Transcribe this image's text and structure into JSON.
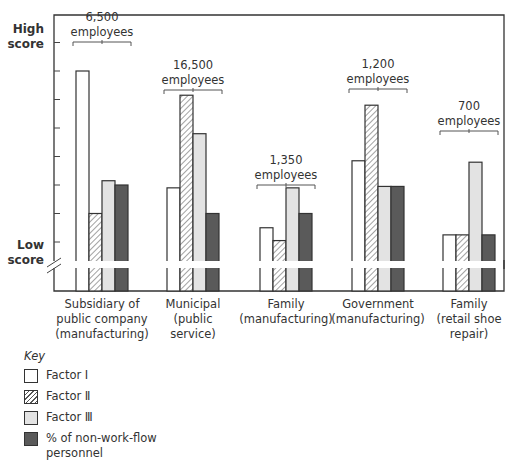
{
  "y_axis": {
    "high_label": "High\nscore",
    "low_label": "Low\nscore"
  },
  "key": {
    "title": "Key",
    "items": [
      {
        "label": "Factor Ⅰ",
        "style": "white"
      },
      {
        "label": "Factor Ⅱ",
        "style": "hatch"
      },
      {
        "label": "Factor Ⅲ",
        "style": "light"
      },
      {
        "label": "% of non-work-flow\npersonnel",
        "style": "dark"
      }
    ]
  },
  "groups": [
    {
      "size_label": "6,500\nemployees",
      "category": "Subsidiary of\npublic company\n(manufacturing)"
    },
    {
      "size_label": "16,500\nemployees",
      "category": "Municipal\n(public\nservice)"
    },
    {
      "size_label": "1,350\nemployees",
      "category": "Family\n(manufacturing)"
    },
    {
      "size_label": "1,200\nemployees",
      "category": "Government\n(manufacturing)"
    },
    {
      "size_label": "700\nemployees",
      "category": "Family\n(retail shoe\nrepair)"
    }
  ],
  "colors": {
    "factor1": "#ffffff",
    "factor2_hatch": "#555555",
    "factor3": "#e3e3e3",
    "nonworkflow": "#5a5a5a",
    "axis": "#333333"
  },
  "chart_data": {
    "type": "bar",
    "title": "",
    "xlabel": "",
    "ylabel": "Score (Low score to High score)",
    "categories": [
      "Subsidiary of public company (manufacturing)",
      "Municipal (public service)",
      "Family (manufacturing)",
      "Government (manufacturing)",
      "Family (retail shoe repair)"
    ],
    "group_annotations": [
      "6,500 employees",
      "16,500 employees",
      "1,350 employees",
      "1,200 employees",
      "700 employees"
    ],
    "series": [
      {
        "name": "Factor I",
        "values": [
          7.0,
          2.9,
          1.5,
          3.85,
          1.25
        ]
      },
      {
        "name": "Factor II",
        "values": [
          2.0,
          6.15,
          1.05,
          5.8,
          1.25
        ]
      },
      {
        "name": "Factor III",
        "values": [
          3.15,
          4.8,
          2.9,
          2.95,
          3.8
        ]
      },
      {
        "name": "% of non-work-flow personnel",
        "values": [
          3.0,
          2.0,
          2.0,
          2.95,
          1.25
        ]
      }
    ],
    "ylim": [
      0,
      8.5
    ],
    "y_ticks_relative": [
      1,
      2,
      3,
      4,
      5,
      6,
      7,
      8
    ],
    "y_tick_labels": {
      "low": "Low score",
      "high": "High score"
    },
    "axis_break": true,
    "grid": false,
    "legend_position": "bottom-left"
  }
}
